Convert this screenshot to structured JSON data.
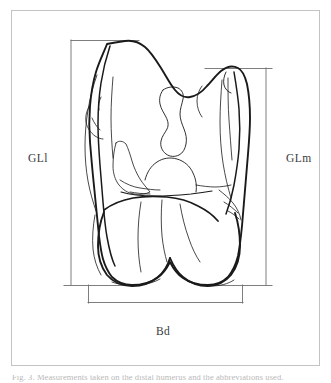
{
  "figure": {
    "view": "anterior-distal-view",
    "frame_color": "#c3c3c3",
    "ink_color": "#1a1a1a",
    "measurement_line_color": "#6f6f6f",
    "background_color": "#ffffff"
  },
  "labels": {
    "left_measurement": "GLl",
    "right_measurement": "GLm",
    "bottom_measurement": "Bd"
  },
  "measurements": [
    {
      "code": "GLl",
      "orientation": "vertical",
      "side": "left",
      "x": 71,
      "y_top": 40,
      "y_bottom": 285,
      "tick_top_x1": 71,
      "tick_top_x2": 139,
      "tick_bottom_x1": 64,
      "tick_bottom_x2": 139
    },
    {
      "code": "GLm",
      "orientation": "vertical",
      "side": "right",
      "x": 266,
      "y_top": 68,
      "y_bottom": 285,
      "tick_top_x1": 205,
      "tick_top_x2": 272,
      "tick_bottom_x1": 205,
      "tick_bottom_x2": 272
    },
    {
      "code": "Bd",
      "orientation": "horizontal",
      "side": "bottom",
      "y": 303,
      "x_left": 88,
      "x_right": 242,
      "tick_left_y_top": 285,
      "tick_right_y_top": 285
    }
  ],
  "caption": {
    "partial_text": "Fig. 3. Measurements taken on the distal humerus and the abbreviations used."
  },
  "icons": {
    "frame": "rectangle-frame",
    "bone": "bone-outline-icon"
  }
}
